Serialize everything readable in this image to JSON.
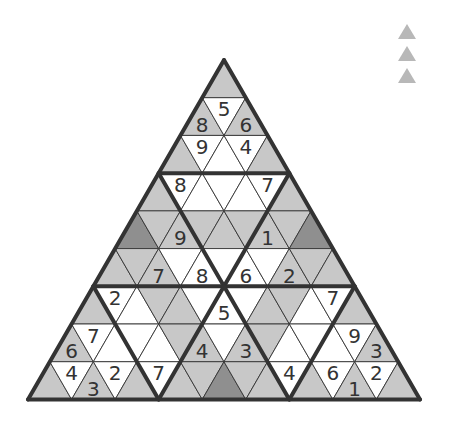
{
  "puzzle": {
    "type": "triangular-sudoku",
    "rows": 9,
    "colors": {
      "W": "#ffffff",
      "G": "#c8c8c8",
      "D": "#8f8f8f",
      "line": "#333333"
    },
    "cells": [
      [
        [
          "G",
          ""
        ]
      ],
      [
        [
          "G",
          "8"
        ],
        [
          "W",
          "5"
        ],
        [
          "G",
          "6"
        ]
      ],
      [
        [
          "G",
          ""
        ],
        [
          "W",
          "9"
        ],
        [
          "W",
          ""
        ],
        [
          "W",
          "4"
        ],
        [
          "G",
          ""
        ]
      ],
      [
        [
          "G",
          ""
        ],
        [
          "W",
          "8"
        ],
        [
          "W",
          ""
        ],
        [
          "W",
          ""
        ],
        [
          "W",
          ""
        ],
        [
          "W",
          "7"
        ],
        [
          "G",
          ""
        ]
      ],
      [
        [
          "D",
          ""
        ],
        [
          "G",
          ""
        ],
        [
          "G",
          "9"
        ],
        [
          "G",
          ""
        ],
        [
          "G",
          ""
        ],
        [
          "G",
          ""
        ],
        [
          "G",
          "1"
        ],
        [
          "G",
          ""
        ],
        [
          "D",
          ""
        ]
      ],
      [
        [
          "G",
          ""
        ],
        [
          "G",
          ""
        ],
        [
          "G",
          "7"
        ],
        [
          "W",
          ""
        ],
        [
          "W",
          "8"
        ],
        [
          "W",
          ""
        ],
        [
          "W",
          "6"
        ],
        [
          "W",
          ""
        ],
        [
          "G",
          "2"
        ],
        [
          "G",
          ""
        ],
        [
          "G",
          ""
        ]
      ],
      [
        [
          "G",
          ""
        ],
        [
          "W",
          "2"
        ],
        [
          "W",
          ""
        ],
        [
          "G",
          ""
        ],
        [
          "G",
          ""
        ],
        [
          "W",
          ""
        ],
        [
          "W",
          "5"
        ],
        [
          "W",
          ""
        ],
        [
          "G",
          ""
        ],
        [
          "G",
          ""
        ],
        [
          "W",
          ""
        ],
        [
          "W",
          "7"
        ],
        [
          "G",
          ""
        ]
      ],
      [
        [
          "G",
          "6"
        ],
        [
          "W",
          "7"
        ],
        [
          "W",
          ""
        ],
        [
          "W",
          ""
        ],
        [
          "W",
          ""
        ],
        [
          "G",
          ""
        ],
        [
          "G",
          "4"
        ],
        [
          "W",
          ""
        ],
        [
          "G",
          "3"
        ],
        [
          "G",
          ""
        ],
        [
          "W",
          ""
        ],
        [
          "W",
          ""
        ],
        [
          "W",
          ""
        ],
        [
          "W",
          "9"
        ],
        [
          "G",
          "3"
        ]
      ],
      [
        [
          "G",
          ""
        ],
        [
          "W",
          "4"
        ],
        [
          "G",
          "3"
        ],
        [
          "W",
          "2"
        ],
        [
          "G",
          ""
        ],
        [
          "W",
          "7"
        ],
        [
          "G",
          ""
        ],
        [
          "G",
          ""
        ],
        [
          "D",
          ""
        ],
        [
          "G",
          ""
        ],
        [
          "G",
          ""
        ],
        [
          "W",
          "4"
        ],
        [
          "G",
          ""
        ],
        [
          "W",
          "6"
        ],
        [
          "G",
          "1"
        ],
        [
          "W",
          "2"
        ],
        [
          "G",
          ""
        ]
      ]
    ]
  },
  "legend": {
    "icons": [
      "triangle-icon",
      "triangle-icon",
      "triangle-icon"
    ]
  }
}
